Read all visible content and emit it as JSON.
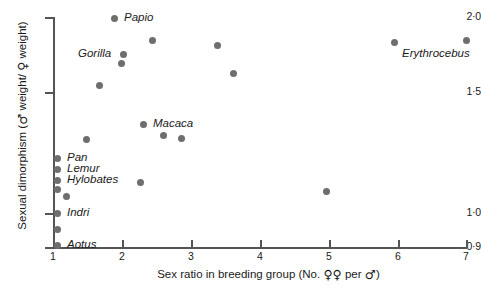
{
  "chart_data": {
    "type": "scatter",
    "title": "",
    "xlabel": "Sex ratio in breeding group (No. ♀♀ per ♂)",
    "ylabel": "Sexual dimorphism (♂ weight/ ♀ weight)",
    "xlim": [
      1,
      7
    ],
    "ylim": [
      0.9,
      2.0
    ],
    "grid": false,
    "legend": "none",
    "xticks": [
      "1",
      "2",
      "3",
      "4",
      "5",
      "6",
      "7"
    ],
    "yticks": [
      "0·9",
      "1·0",
      "1·5",
      "2·0"
    ],
    "ytick_values": [
      0.9,
      1.0,
      1.5,
      2.0
    ],
    "axis_note": "y-axis spacing is non-linear / compressed below 1.5",
    "points": [
      {
        "x": 1.9,
        "y": 1.96,
        "label": "Papio",
        "px": 114,
        "py": 18,
        "lx": 124,
        "ly": 11
      },
      {
        "x": 2.4,
        "y": 1.82,
        "label": "",
        "px": 152,
        "py": 40,
        "lx": 0,
        "ly": 0
      },
      {
        "x": 2.0,
        "y": 1.73,
        "label": "Gorilla",
        "px": 123,
        "py": 54,
        "lx": 78,
        "ly": 47
      },
      {
        "x": 2.0,
        "y": 1.69,
        "label": "",
        "px": 121,
        "py": 63,
        "lx": 0,
        "ly": 0
      },
      {
        "x": 3.4,
        "y": 1.78,
        "label": "",
        "px": 217,
        "py": 45,
        "lx": 0,
        "ly": 0
      },
      {
        "x": 6.0,
        "y": 1.77,
        "label": "",
        "px": 394,
        "py": 42,
        "lx": 0,
        "ly": 0
      },
      {
        "x": 7.0,
        "y": 1.8,
        "label": "Erythrocebus",
        "px": 466,
        "py": 40,
        "lx": 402,
        "ly": 47
      },
      {
        "x": 1.65,
        "y": 1.54,
        "label": "",
        "px": 99,
        "py": 85,
        "lx": 0,
        "ly": 0
      },
      {
        "x": 3.6,
        "y": 1.61,
        "label": "",
        "px": 233,
        "py": 73,
        "lx": 0,
        "ly": 0
      },
      {
        "x": 2.6,
        "y": 1.32,
        "label": "Macaca",
        "px": 143,
        "py": 124,
        "lx": 153,
        "ly": 117
      },
      {
        "x": 2.7,
        "y": 1.27,
        "label": "",
        "px": 163,
        "py": 135,
        "lx": 0,
        "ly": 0
      },
      {
        "x": 2.9,
        "y": 1.26,
        "label": "",
        "px": 181,
        "py": 138,
        "lx": 0,
        "ly": 0
      },
      {
        "x": 1.5,
        "y": 1.25,
        "label": "",
        "px": 86,
        "py": 139,
        "lx": 0,
        "ly": 0
      },
      {
        "x": 2.3,
        "y": 1.12,
        "label": "",
        "px": 140,
        "py": 182,
        "lx": 0,
        "ly": 0
      },
      {
        "x": 4.95,
        "y": 1.11,
        "label": "",
        "px": 326,
        "py": 191,
        "lx": 0,
        "ly": 0
      },
      {
        "x": 1.05,
        "y": 1.18,
        "label": "Pan",
        "px": 57,
        "py": 158,
        "lx": 67,
        "ly": 151
      },
      {
        "x": 1.05,
        "y": 1.15,
        "label": "Lemur",
        "px": 57,
        "py": 169,
        "lx": 67,
        "ly": 162
      },
      {
        "x": 1.05,
        "y": 1.11,
        "label": "Hylobates",
        "px": 57,
        "py": 180,
        "lx": 67,
        "ly": 173
      },
      {
        "x": 1.05,
        "y": 1.08,
        "label": "",
        "px": 57,
        "py": 189,
        "lx": 0,
        "ly": 0
      },
      {
        "x": 1.15,
        "y": 1.06,
        "label": "",
        "px": 66,
        "py": 196,
        "lx": 0,
        "ly": 0
      },
      {
        "x": 1.05,
        "y": 1.0,
        "label": "Indri",
        "px": 57,
        "py": 213,
        "lx": 67,
        "ly": 206
      },
      {
        "x": 1.05,
        "y": 0.95,
        "label": "",
        "px": 57,
        "py": 229,
        "lx": 0,
        "ly": 0
      },
      {
        "x": 1.05,
        "y": 0.9,
        "label": "Aotus",
        "px": 57,
        "py": 245,
        "lx": 67,
        "ly": 238
      }
    ],
    "ytick_px": [
      247,
      213,
      92,
      17
    ],
    "xtick_px": [
      53,
      122,
      191,
      260,
      329,
      398,
      466
    ]
  }
}
